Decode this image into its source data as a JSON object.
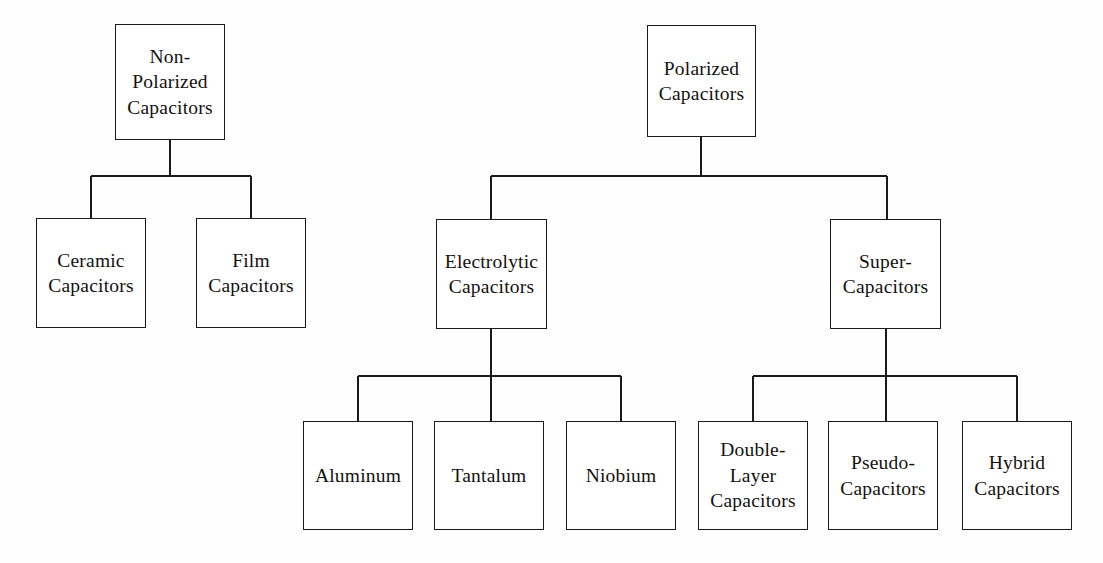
{
  "diagram": {
    "type": "tree-diagram",
    "background_color": "#fefefe",
    "line_color": "#1a1a1a",
    "text_color": "#14110f",
    "nodes": [
      {
        "id": "non-polarized-capacitors",
        "label": "Non-\nPolarized\nCapacitors",
        "level": 0,
        "x": 115,
        "y": 24,
        "w": 110,
        "h": 116
      },
      {
        "id": "polarized-capacitors",
        "label": "Polarized\nCapacitors",
        "level": 0,
        "x": 647,
        "y": 25,
        "w": 109,
        "h": 112
      },
      {
        "id": "ceramic-capacitors",
        "label": "Ceramic\nCapacitors",
        "level": 1,
        "x": 36,
        "y": 218,
        "w": 110,
        "h": 110
      },
      {
        "id": "film-capacitors",
        "label": "Film\nCapacitors",
        "level": 1,
        "x": 196,
        "y": 218,
        "w": 110,
        "h": 110
      },
      {
        "id": "electrolytic-capacitors",
        "label": "Electrolytic\nCapacitors",
        "level": 1,
        "x": 436,
        "y": 219,
        "w": 111,
        "h": 110
      },
      {
        "id": "super-capacitors",
        "label": "Super-\nCapacitors",
        "level": 1,
        "x": 830,
        "y": 219,
        "w": 111,
        "h": 110
      },
      {
        "id": "aluminum-capacitors",
        "label": "Aluminum",
        "level": 2,
        "x": 303,
        "y": 421,
        "w": 110,
        "h": 109
      },
      {
        "id": "tantalum-capacitors",
        "label": "Tantalum",
        "level": 2,
        "x": 434,
        "y": 421,
        "w": 110,
        "h": 109
      },
      {
        "id": "niobium-capacitors",
        "label": "Niobium",
        "level": 2,
        "x": 566,
        "y": 421,
        "w": 110,
        "h": 109
      },
      {
        "id": "double-layer-capacitors",
        "label": "Double-\nLayer\nCapacitors",
        "level": 2,
        "x": 698,
        "y": 421,
        "w": 110,
        "h": 109
      },
      {
        "id": "pseudo-capacitors",
        "label": "Pseudo-\nCapacitors",
        "level": 2,
        "x": 828,
        "y": 421,
        "w": 110,
        "h": 109
      },
      {
        "id": "hybrid-capacitors",
        "label": "Hybrid\nCapacitors",
        "level": 2,
        "x": 962,
        "y": 421,
        "w": 110,
        "h": 109
      }
    ],
    "connectors": [
      {
        "id": "non-polarized-to-children",
        "parent": "non-polarized-capacitors",
        "children": [
          "ceramic-capacitors",
          "film-capacitors"
        ],
        "parent_stem": {
          "x": 170,
          "y1": 140,
          "y2": 176
        },
        "bus": {
          "y": 176,
          "x1": 91,
          "x2": 251
        },
        "drops": [
          {
            "x": 91,
            "y1": 176,
            "y2": 218
          },
          {
            "x": 251,
            "y1": 176,
            "y2": 218
          }
        ]
      },
      {
        "id": "polarized-to-children",
        "parent": "polarized-capacitors",
        "children": [
          "electrolytic-capacitors",
          "super-capacitors"
        ],
        "parent_stem": {
          "x": 701,
          "y1": 137,
          "y2": 176
        },
        "bus": {
          "y": 176,
          "x1": 491,
          "x2": 887
        },
        "drops": [
          {
            "x": 491,
            "y1": 176,
            "y2": 219
          },
          {
            "x": 887,
            "y1": 176,
            "y2": 219
          }
        ]
      },
      {
        "id": "electrolytic-to-children",
        "parent": "electrolytic-capacitors",
        "children": [
          "aluminum-capacitors",
          "tantalum-capacitors",
          "niobium-capacitors"
        ],
        "parent_stem": {
          "x": 491,
          "y1": 329,
          "y2": 421
        },
        "bus": {
          "y": 376,
          "x1": 358,
          "x2": 621
        },
        "drops": [
          {
            "x": 358,
            "y1": 376,
            "y2": 421
          },
          {
            "x": 491,
            "y1": 376,
            "y2": 421
          },
          {
            "x": 621,
            "y1": 376,
            "y2": 421
          }
        ]
      },
      {
        "id": "super-capacitors-to-children",
        "parent": "super-capacitors",
        "children": [
          "double-layer-capacitors",
          "pseudo-capacitors",
          "hybrid-capacitors"
        ],
        "parent_stem": {
          "x": 886,
          "y1": 329,
          "y2": 421
        },
        "bus": {
          "y": 376,
          "x1": 753,
          "x2": 1017
        },
        "drops": [
          {
            "x": 753,
            "y1": 376,
            "y2": 421
          },
          {
            "x": 886,
            "y1": 376,
            "y2": 421
          },
          {
            "x": 1017,
            "y1": 376,
            "y2": 421
          }
        ]
      }
    ]
  }
}
